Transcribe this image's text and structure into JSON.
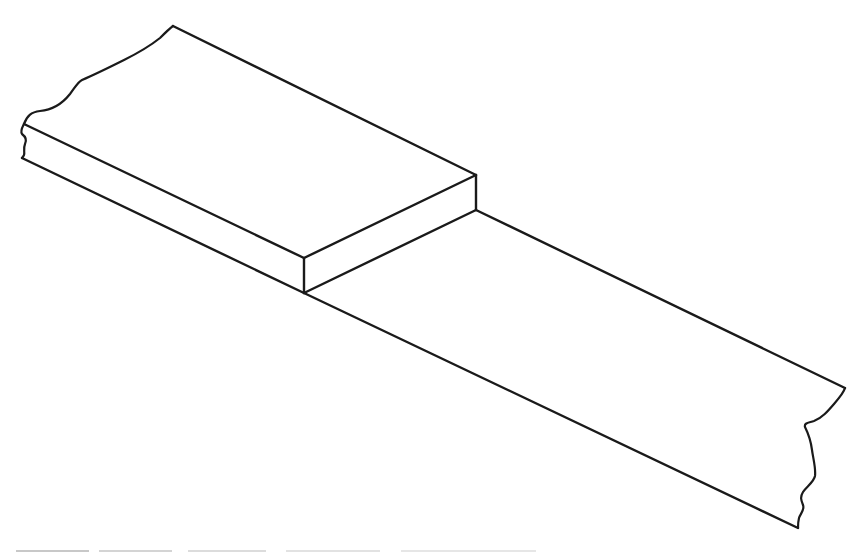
{
  "figure": {
    "description": "Isometric line drawing of a thick rectangular plate resting on a thinner, longer strip (lap joint); both pieces shown with irregular break lines at their cut ends.",
    "line_color": "#1a1a1a",
    "background": "#ffffff",
    "caption_visible": false,
    "caption_note": "Caption line cut off at the bottom edge; only top sliver visible"
  }
}
